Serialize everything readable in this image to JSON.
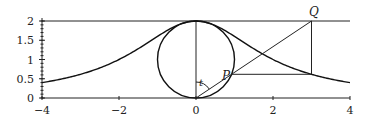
{
  "chart_data": {
    "type": "line",
    "title": "",
    "a": 2,
    "curve": "y = 8/(x^2+4)",
    "xlim": [
      -4,
      4
    ],
    "ylim": [
      0,
      2
    ],
    "x_ticks": [
      "-4",
      "-2",
      "0",
      "2",
      "4"
    ],
    "x_tick_values": [
      -4,
      -2,
      0,
      2,
      4
    ],
    "y_ticks": [
      "0",
      "0.5",
      "1",
      "1.5",
      "2"
    ],
    "y_tick_values": [
      0,
      0.5,
      1,
      1.5,
      2
    ],
    "circle": {
      "center": [
        0,
        1
      ],
      "radius": 1
    },
    "Q": [
      3,
      2
    ],
    "labels": {
      "P": "P",
      "Q": "Q",
      "angle": "t"
    }
  }
}
